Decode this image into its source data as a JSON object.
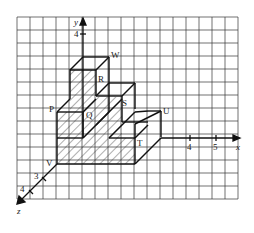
{
  "figure": {
    "type": "3d-cube-staircase-on-grid",
    "axes": {
      "x": {
        "label": "x",
        "ticks": [
          "4",
          "5"
        ]
      },
      "y": {
        "label": "y",
        "ticks": [
          "4"
        ]
      },
      "z": {
        "label": "z",
        "ticks": [
          "3",
          "4"
        ]
      }
    },
    "points": {
      "P": "P",
      "Q": "Q",
      "R": "R",
      "S": "S",
      "T": "T",
      "U": "U",
      "V": "V",
      "W": "W"
    },
    "colors": {
      "grid": "#333333",
      "lines": "#111111",
      "hatch": "#333333",
      "background": "#ffffff"
    }
  }
}
